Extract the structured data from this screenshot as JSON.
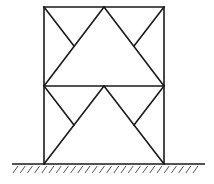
{
  "diagram": {
    "type": "two-story knee-braced frame with chevron bracing on fixed ground support",
    "colors": {
      "line": "#1a1a1a",
      "hatch": "#555555",
      "background": "#ffffff"
    },
    "nodes": {
      "A_base_left": [
        44,
        164
      ],
      "B_base_right": [
        164,
        164
      ],
      "C_floor1_left": [
        44,
        86
      ],
      "D_floor1_mid": [
        104,
        86
      ],
      "E_floor1_right": [
        164,
        86
      ],
      "F_roof_left": [
        44,
        7
      ],
      "G_roof_mid": [
        104,
        7
      ],
      "H_roof_right": [
        164,
        7
      ],
      "K1_lower_left_knee": [
        74,
        125
      ],
      "K2_lower_right_knee": [
        134,
        125
      ],
      "K3_upper_left_knee": [
        74,
        46
      ],
      "K4_upper_right_knee": [
        134,
        46
      ]
    },
    "members": [
      {
        "name": "left-column-lower",
        "from": "A_base_left",
        "to": "C_floor1_left"
      },
      {
        "name": "left-column-upper",
        "from": "C_floor1_left",
        "to": "F_roof_left"
      },
      {
        "name": "right-column-lower",
        "from": "B_base_right",
        "to": "E_floor1_right"
      },
      {
        "name": "right-column-upper",
        "from": "E_floor1_right",
        "to": "H_roof_right"
      },
      {
        "name": "floor1-beam",
        "from": "C_floor1_left",
        "to": "E_floor1_right"
      },
      {
        "name": "roof-beam",
        "from": "F_roof_left",
        "to": "H_roof_right"
      },
      {
        "name": "lower-left-diagonal",
        "from": "A_base_left",
        "to": "D_floor1_mid"
      },
      {
        "name": "lower-right-diagonal",
        "from": "B_base_right",
        "to": "D_floor1_mid"
      },
      {
        "name": "upper-left-diagonal",
        "from": "C_floor1_left",
        "to": "G_roof_mid"
      },
      {
        "name": "upper-right-diagonal",
        "from": "E_floor1_right",
        "to": "G_roof_mid"
      },
      {
        "name": "lower-left-knee-brace",
        "from": "C_floor1_left",
        "to": "K1_lower_left_knee"
      },
      {
        "name": "lower-right-knee-brace",
        "from": "E_floor1_right",
        "to": "K2_lower_right_knee"
      },
      {
        "name": "upper-left-knee-brace",
        "from": "F_roof_left",
        "to": "K3_upper_left_knee"
      },
      {
        "name": "upper-right-knee-brace",
        "from": "H_roof_right",
        "to": "K4_upper_right_knee"
      }
    ],
    "ground": {
      "y": 164,
      "x_start": 12,
      "x_end": 205,
      "hatch_count": 26,
      "hatch_spacing": 7.2,
      "hatch_length": 7
    }
  }
}
